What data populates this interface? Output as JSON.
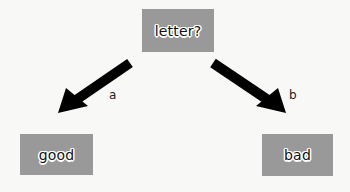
{
  "diagram": {
    "type": "decision-tree",
    "root": {
      "label": "letter?"
    },
    "children": [
      {
        "label": "good",
        "edge_label": "a"
      },
      {
        "label": "bad",
        "edge_label": "b"
      }
    ],
    "colors": {
      "node_fill": "#999999",
      "arrow": "#000000",
      "background": "#f8f8f6",
      "text": "#111111"
    }
  }
}
